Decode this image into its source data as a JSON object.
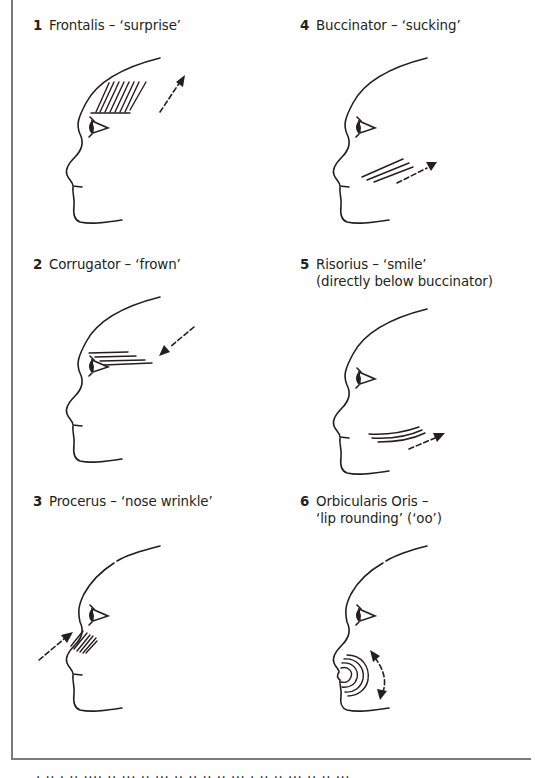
{
  "diagram": {
    "type": "facial muscle diagram",
    "panels": [
      {
        "number": "1",
        "title": "Frontalis – ‘surprise’",
        "subtitle": "",
        "muscle": "frontalis",
        "marking": "diagonal hatching on forehead",
        "arrow": "dashed arrow up-right"
      },
      {
        "number": "2",
        "title": "Corrugator – ‘frown’",
        "subtitle": "",
        "muscle": "corrugator",
        "marking": "horizontal lines above eye",
        "arrow": "dashed arrow down-left toward brow"
      },
      {
        "number": "3",
        "title": "Procerus – ‘nose wrinkle’",
        "subtitle": "",
        "muscle": "procerus",
        "marking": "diagonal hatching on nose bridge",
        "arrow": "dashed arrow up-right toward nose"
      },
      {
        "number": "4",
        "title": "Buccinator – ‘sucking’",
        "subtitle": "",
        "muscle": "buccinator",
        "marking": "diagonal lines on cheek",
        "arrow": "dashed arrow up-right"
      },
      {
        "number": "5",
        "title": "Risorius – ‘smile’",
        "subtitle": "(directly below buccinator)",
        "muscle": "risorius",
        "marking": "curved lines at lower cheek",
        "arrow": "dashed arrow up-right"
      },
      {
        "number": "6",
        "title": "Orbicularis Oris –",
        "subtitle": "‘lip rounding’ (‘oo’)",
        "muscle": "orbicularis oris",
        "marking": "concentric arcs around lips",
        "arrow": "curved double-headed dashed arrow"
      }
    ],
    "footer_text": "· ·· ·  ·· ···· ·· ···  ·· ··· ··  ·· ·· ·· ··· ·  ·· ·· ··· ·· ·· ···"
  },
  "colors": {
    "ink": "#231f20",
    "frame": "#7a7a7a",
    "background": "#ffffff"
  }
}
